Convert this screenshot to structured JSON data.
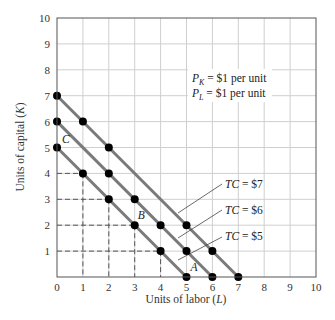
{
  "chart_data": {
    "type": "line",
    "title": "",
    "xlabel": "Units of labor (L)",
    "xlabel_parts": [
      "Units of labor (",
      "L",
      ")"
    ],
    "ylabel": "Units of capital (K)",
    "ylabel_parts": [
      "Units of capital (",
      "K",
      ")"
    ],
    "xlim": [
      0,
      10
    ],
    "ylim": [
      0,
      10
    ],
    "x_ticks": [
      "0",
      "1",
      "2",
      "3",
      "4",
      "5",
      "6",
      "7",
      "8",
      "9",
      "10"
    ],
    "y_ticks": [
      "1",
      "2",
      "3",
      "4",
      "5",
      "6",
      "7",
      "8",
      "9",
      "10"
    ],
    "grid": true,
    "series": [
      {
        "name": "TC = $7",
        "label_prefix": "TC",
        "label_suffix": " = $7",
        "line": [
          [
            0,
            7
          ],
          [
            7,
            0
          ]
        ],
        "points": [
          [
            0,
            7
          ],
          [
            1,
            6
          ],
          [
            2,
            5
          ],
          [
            5,
            2
          ],
          [
            6,
            1
          ],
          [
            7,
            0
          ]
        ]
      },
      {
        "name": "TC = $6",
        "label_prefix": "TC",
        "label_suffix": " = $6",
        "line": [
          [
            0,
            6
          ],
          [
            6,
            0
          ]
        ],
        "points": [
          [
            0,
            6
          ],
          [
            2,
            4
          ],
          [
            3,
            3
          ],
          [
            4,
            2
          ],
          [
            5,
            1
          ],
          [
            6,
            0
          ]
        ]
      },
      {
        "name": "TC = $5",
        "label_prefix": "TC",
        "label_suffix": " = $5",
        "line": [
          [
            0,
            5
          ],
          [
            5,
            0
          ]
        ],
        "points": [
          [
            0,
            5
          ],
          [
            1,
            4
          ],
          [
            2,
            3
          ],
          [
            3,
            2
          ],
          [
            4,
            1
          ],
          [
            5,
            0
          ]
        ]
      }
    ],
    "dashed_guides": [
      [
        1,
        4
      ],
      [
        2,
        3
      ],
      [
        3,
        2
      ],
      [
        4,
        1
      ]
    ],
    "point_labels": [
      {
        "label": "A",
        "x": 5,
        "y": 0
      },
      {
        "label": "B",
        "x": 3,
        "y": 2
      },
      {
        "label": "C",
        "x": 0,
        "y": 5
      }
    ],
    "annotations": [
      {
        "var": "P",
        "sub": "K",
        "text": " = $1 per unit"
      },
      {
        "var": "P",
        "sub": "L",
        "text": " = $1 per unit"
      }
    ]
  }
}
